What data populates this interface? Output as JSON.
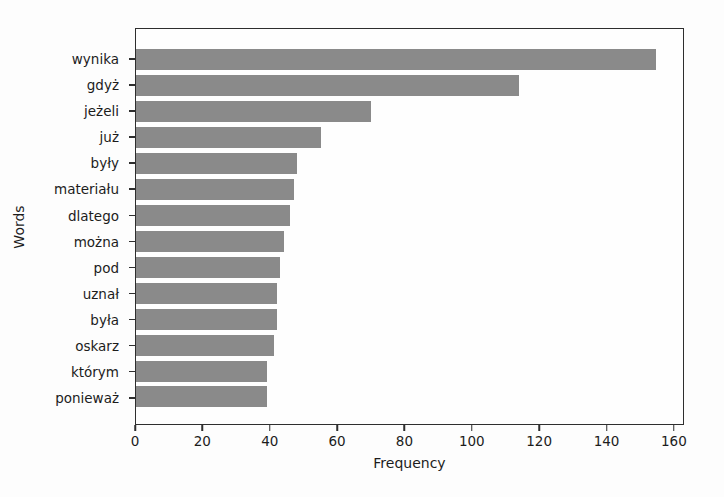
{
  "figure": {
    "background": "#fdfdfd",
    "bar_color": "#8a8a8a",
    "spine_color": "#2e2e2e"
  },
  "chart_data": {
    "type": "bar",
    "orientation": "horizontal",
    "title": "",
    "xlabel": "Frequency",
    "ylabel": "Words",
    "categories": [
      "wynika",
      "gdyż",
      "jeżeli",
      "już",
      "były",
      "materiału",
      "dlatego",
      "można",
      "pod",
      "uznał",
      "była",
      "oskarz",
      "którym",
      "ponieważ"
    ],
    "values": [
      155,
      114,
      70,
      55,
      48,
      47,
      46,
      44,
      43,
      42,
      42,
      41,
      39,
      39
    ],
    "x_ticks": [
      0,
      20,
      40,
      60,
      80,
      100,
      120,
      140,
      160
    ],
    "xlim": [
      0,
      163
    ],
    "grid": false,
    "legend": false
  }
}
